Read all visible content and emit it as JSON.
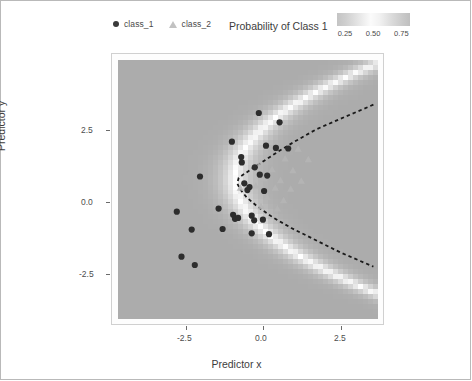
{
  "legend": {
    "items": [
      {
        "label": "class_1",
        "marker": "circle-marker",
        "color": "#3a3a3a"
      },
      {
        "label": "class_2",
        "marker": "triangle-marker",
        "color": "#c2c2c2"
      }
    ]
  },
  "colorbar": {
    "title": "Probability of Class 1",
    "ticks": [
      "0.25",
      "0.50",
      "0.75"
    ],
    "low_color": "#c4c4c4",
    "mid_color": "#fbfbfb",
    "high_color": "#bfbfbf"
  },
  "axes": {
    "x_label": "Predictor x",
    "y_label": "Predictor y",
    "x_ticks": [
      "-2.5",
      "0.0",
      "2.5"
    ],
    "y_ticks": [
      "2.5",
      "0.0",
      "-2.5"
    ]
  },
  "chart_data": {
    "type": "scatter",
    "title": "",
    "xlabel": "Predictor x",
    "ylabel": "Predictor y",
    "xlim": [
      -4.2,
      4.2
    ],
    "ylim": [
      -4.2,
      4.2
    ],
    "grid": false,
    "legend_position": "top",
    "background": "probability-heatmap",
    "colorbar": {
      "label": "Probability of Class 1",
      "ticks": [
        0.25,
        0.5,
        0.75
      ],
      "range": [
        0.0,
        1.0
      ]
    },
    "decision_boundary": {
      "style": "dashed",
      "color": "#1a1a1a",
      "description": "parabola opening rightward, vertex near x = -0.35, y = 0.35",
      "points": [
        [
          4.05,
          2.75
        ],
        [
          3.0,
          2.3
        ],
        [
          2.2,
          1.95
        ],
        [
          1.5,
          1.55
        ],
        [
          1.0,
          1.25
        ],
        [
          0.55,
          0.95
        ],
        [
          0.2,
          0.72
        ],
        [
          -0.1,
          0.52
        ],
        [
          -0.3,
          0.38
        ],
        [
          -0.35,
          0.2
        ],
        [
          -0.25,
          0.0
        ],
        [
          -0.05,
          -0.25
        ],
        [
          0.3,
          -0.55
        ],
        [
          0.8,
          -0.9
        ],
        [
          1.4,
          -1.25
        ],
        [
          2.1,
          -1.6
        ],
        [
          3.0,
          -2.05
        ],
        [
          4.05,
          -2.5
        ]
      ]
    },
    "series": [
      {
        "name": "class_1",
        "marker": "circle",
        "color": "#2d2d2d",
        "points": [
          [
            0.35,
            2.48
          ],
          [
            1.02,
            2.18
          ],
          [
            -0.52,
            1.55
          ],
          [
            0.58,
            1.42
          ],
          [
            0.9,
            1.35
          ],
          [
            1.3,
            1.33
          ],
          [
            -0.22,
            1.05
          ],
          [
            -0.2,
            0.88
          ],
          [
            0.22,
            0.72
          ],
          [
            0.38,
            0.48
          ],
          [
            0.62,
            0.45
          ],
          [
            -1.55,
            0.42
          ],
          [
            -0.12,
            0.2
          ],
          [
            0.05,
            0.08
          ],
          [
            -0.02,
            -0.02
          ],
          [
            0.52,
            -0.05
          ],
          [
            -2.3,
            -0.72
          ],
          [
            -0.95,
            -0.62
          ],
          [
            -0.48,
            -0.82
          ],
          [
            -0.42,
            -0.95
          ],
          [
            -0.32,
            -0.92
          ],
          [
            0.12,
            -0.85
          ],
          [
            0.2,
            -1.0
          ],
          [
            0.48,
            -0.98
          ],
          [
            -1.82,
            -1.3
          ],
          [
            -0.82,
            -1.28
          ],
          [
            0.12,
            -1.42
          ],
          [
            0.68,
            -1.45
          ],
          [
            -2.15,
            -2.18
          ],
          [
            -1.72,
            -2.45
          ]
        ]
      },
      {
        "name": "class_2",
        "marker": "triangle",
        "color": "#b5b5b5",
        "points": [
          [
            1.62,
            1.32
          ],
          [
            1.2,
            1.0
          ],
          [
            1.95,
            0.98
          ],
          [
            0.35,
            0.78
          ],
          [
            0.78,
            0.65
          ],
          [
            1.45,
            0.62
          ],
          [
            0.52,
            0.35
          ],
          [
            1.05,
            0.3
          ],
          [
            1.72,
            0.28
          ],
          [
            0.25,
            0.12
          ],
          [
            0.88,
            0.05
          ],
          [
            1.38,
            0.02
          ],
          [
            -0.25,
            0.05
          ],
          [
            0.62,
            -0.25
          ],
          [
            1.15,
            -0.35
          ],
          [
            0.42,
            -0.55
          ],
          [
            0.95,
            -0.62
          ]
        ]
      }
    ]
  }
}
